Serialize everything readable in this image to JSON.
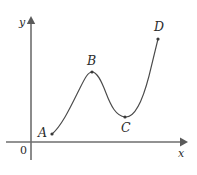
{
  "figure": {
    "type": "curve-diagram",
    "background_color": "#ffffff",
    "curve_color": "#4a4a4a",
    "axis_color": "#6e6e6e",
    "point_color": "#3a3a3a",
    "label_color": "#2b2b2b"
  },
  "axes": {
    "x_label": "x",
    "y_label": "y",
    "origin_label": "0",
    "x_axis": {
      "y": 142,
      "x_start": 6,
      "x_end": 182
    },
    "y_axis": {
      "x": 31,
      "y_start": 158,
      "y_end": 22
    }
  },
  "points": [
    {
      "id": "A",
      "label": "A",
      "cx": 52,
      "cy": 134,
      "label_x": 38,
      "label_y": 127
    },
    {
      "id": "B",
      "label": "B",
      "cx": 92,
      "cy": 72,
      "label_x": 87,
      "label_y": 55
    },
    {
      "id": "C",
      "label": "C",
      "cx": 125,
      "cy": 117,
      "label_x": 121,
      "label_y": 122
    },
    {
      "id": "D",
      "label": "D",
      "cx": 158,
      "cy": 39,
      "label_x": 154,
      "label_y": 21
    }
  ],
  "chart_data": {
    "type": "line",
    "title": "",
    "xlabel": "x",
    "ylabel": "y",
    "grid": false,
    "legend": false,
    "annotations": [
      "A",
      "B",
      "C",
      "D",
      "0"
    ],
    "path": "M 52 134 C 62 126, 72 104, 80 88 C 85 78, 88 72, 92 72 C 97 72, 101 80, 106 93 C 111 106, 116 116, 125 117 C 134 118, 142 103, 149 76 C 153 60, 156 47, 158 39"
  }
}
